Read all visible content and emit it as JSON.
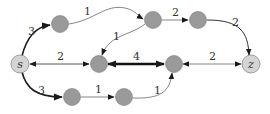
{
  "diagram": {
    "type": "directed weighted graph",
    "colors": {
      "inner_node_fill": "#9a9a9a",
      "inner_node_stroke": "#7a7a7a",
      "terminal_node_fill": "#d4d4d4",
      "terminal_node_stroke": "#8a8a8a",
      "edge": "#333333",
      "thin_edge": "#666666"
    },
    "nodes": [
      {
        "id": "s",
        "label": "s",
        "x": 20,
        "y": 64,
        "terminal": true
      },
      {
        "id": "a",
        "label": "",
        "x": 60,
        "y": 24,
        "terminal": false
      },
      {
        "id": "b",
        "label": "",
        "x": 153,
        "y": 20,
        "terminal": false
      },
      {
        "id": "c",
        "label": "",
        "x": 198,
        "y": 20,
        "terminal": false
      },
      {
        "id": "d",
        "label": "",
        "x": 99,
        "y": 64,
        "terminal": false
      },
      {
        "id": "e",
        "label": "",
        "x": 174,
        "y": 64,
        "terminal": false
      },
      {
        "id": "z",
        "label": "z",
        "x": 251,
        "y": 64,
        "terminal": true
      },
      {
        "id": "f",
        "label": "",
        "x": 72,
        "y": 97,
        "terminal": false
      },
      {
        "id": "g",
        "label": "",
        "x": 124,
        "y": 97,
        "terminal": false
      }
    ],
    "edges": [
      {
        "from": "s",
        "to": "a",
        "weight": "3",
        "bidirectional": false,
        "thick": true
      },
      {
        "from": "a",
        "to": "b",
        "weight": "1",
        "bidirectional": false,
        "thick": false
      },
      {
        "from": "b",
        "to": "d",
        "weight": "1",
        "bidirectional": false,
        "thick": false
      },
      {
        "from": "b",
        "to": "c",
        "weight": "2",
        "bidirectional": false,
        "thick": false
      },
      {
        "from": "c",
        "to": "z",
        "weight": "2",
        "bidirectional": false,
        "thick": false
      },
      {
        "from": "d",
        "to": "s",
        "weight": "2",
        "bidirectional": true,
        "thick": false
      },
      {
        "from": "d",
        "to": "e",
        "weight": "4",
        "bidirectional": true,
        "thick": true
      },
      {
        "from": "e",
        "to": "z",
        "weight": "2",
        "bidirectional": true,
        "thick": false
      },
      {
        "from": "s",
        "to": "f",
        "weight": "3",
        "bidirectional": false,
        "thick": true
      },
      {
        "from": "f",
        "to": "g",
        "weight": "1",
        "bidirectional": false,
        "thick": false
      },
      {
        "from": "g",
        "to": "e",
        "weight": "1",
        "bidirectional": false,
        "thick": false
      }
    ],
    "edge_labels": {
      "s_a": "3",
      "a_b": "1",
      "b_d": "1",
      "b_c": "2",
      "c_z": "2",
      "s_d": "2",
      "d_e": "4",
      "e_z": "2",
      "s_f": "3",
      "f_g": "1",
      "g_e": "1"
    },
    "node_labels": {
      "s": "s",
      "z": "z"
    }
  }
}
